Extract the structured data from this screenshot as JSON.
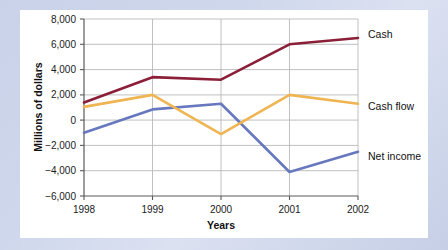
{
  "chart_data": {
    "type": "line",
    "title": "",
    "xlabel": "Years",
    "ylabel": "Millions of dollars",
    "categories": [
      "1998",
      "1999",
      "2000",
      "2001",
      "2002"
    ],
    "x": [
      1998,
      1999,
      2000,
      2001,
      2002
    ],
    "xlim": [
      1998,
      2002
    ],
    "ylim": [
      -6000,
      8000
    ],
    "ytick_labels": [
      "8,000",
      "6,000",
      "4,000",
      "2,000",
      "0",
      "−2,000",
      "−4,000",
      "−6,000"
    ],
    "ytick_values": [
      8000,
      6000,
      4000,
      2000,
      0,
      -2000,
      -4000,
      -6000
    ],
    "grid": true,
    "grid_axis": "both",
    "legend_position": "right-inline-labels",
    "series": [
      {
        "name": "Cash",
        "color": "#8c1f38",
        "values": [
          1400,
          3400,
          3200,
          6000,
          6500
        ]
      },
      {
        "name": "Cash flow",
        "color": "#efb552",
        "values": [
          1050,
          2000,
          -1100,
          2000,
          1300
        ]
      },
      {
        "name": "Net income",
        "color": "#6778bf",
        "values": [
          -1000,
          850,
          1300,
          -4100,
          -2500
        ]
      }
    ]
  },
  "labels": {
    "y_axis_title": "Millions of dollars",
    "x_axis_title": "Years",
    "series_cash": "Cash",
    "series_cash_flow": "Cash flow",
    "series_net_income": "Net income",
    "ytick_0": "8,000",
    "ytick_1": "6,000",
    "ytick_2": "4,000",
    "ytick_3": "2,000",
    "ytick_4": "0",
    "ytick_5": "−2,000",
    "ytick_6": "−4,000",
    "ytick_7": "−6,000",
    "xtick_0": "1998",
    "xtick_1": "1999",
    "xtick_2": "2000",
    "xtick_3": "2001",
    "xtick_4": "2002"
  },
  "colors": {
    "cash": "#8c1f38",
    "cash_flow": "#efb552",
    "net_income": "#6778bf",
    "axis": "#5a5a5a",
    "grid": "#b9b9b9",
    "card_background": "#ffffff",
    "page_background": "#ccd4ea"
  }
}
